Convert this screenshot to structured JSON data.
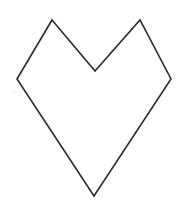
{
  "figure": {
    "width": 183,
    "height": 214,
    "background_color": "#ffffff",
    "stroke_color": "#2b2b2b",
    "stroke_width": 1.6,
    "fill_color": "none",
    "shape_kind": "polygon",
    "vertex_count": 6
  },
  "shape": {
    "name": "heart-outline",
    "points_attr": "52,20 95,71 140,20 171,79 94,196 17,79",
    "vertices": [
      {
        "name": "left-peak",
        "x": 52,
        "y": 20
      },
      {
        "name": "center-notch",
        "x": 95,
        "y": 71
      },
      {
        "name": "right-peak",
        "x": 140,
        "y": 20
      },
      {
        "name": "right-shoulder",
        "x": 171,
        "y": 79
      },
      {
        "name": "bottom-point",
        "x": 94,
        "y": 196
      },
      {
        "name": "left-shoulder",
        "x": 17,
        "y": 79
      }
    ]
  },
  "artifacts": {
    "speck": {
      "x": 13,
      "y": 91,
      "color": "#e2e2e2"
    }
  }
}
